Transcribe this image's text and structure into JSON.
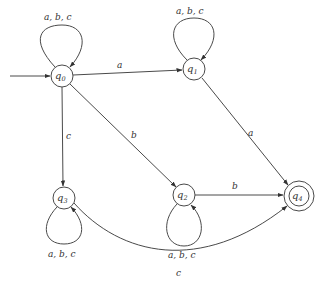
{
  "diagram": {
    "type": "finite-automaton",
    "start_state": "q0",
    "accept_states": [
      "q4"
    ],
    "states": [
      {
        "id": "q0",
        "base": "q",
        "sub": "0"
      },
      {
        "id": "q1",
        "base": "q",
        "sub": "1"
      },
      {
        "id": "q2",
        "base": "q",
        "sub": "2"
      },
      {
        "id": "q3",
        "base": "q",
        "sub": "3"
      },
      {
        "id": "q4",
        "base": "q",
        "sub": "4"
      }
    ],
    "transitions": [
      {
        "from": "q0",
        "to": "q0",
        "label": "a, b, c"
      },
      {
        "from": "q0",
        "to": "q1",
        "label": "a"
      },
      {
        "from": "q0",
        "to": "q2",
        "label": "b"
      },
      {
        "from": "q0",
        "to": "q3",
        "label": "c"
      },
      {
        "from": "q1",
        "to": "q1",
        "label": "a, b, c"
      },
      {
        "from": "q1",
        "to": "q4",
        "label": "a"
      },
      {
        "from": "q2",
        "to": "q2",
        "label": "a, b, c"
      },
      {
        "from": "q2",
        "to": "q4",
        "label": "b"
      },
      {
        "from": "q3",
        "to": "q3",
        "label": "a, b, c"
      },
      {
        "from": "q3",
        "to": "q4",
        "label": "c"
      }
    ]
  }
}
